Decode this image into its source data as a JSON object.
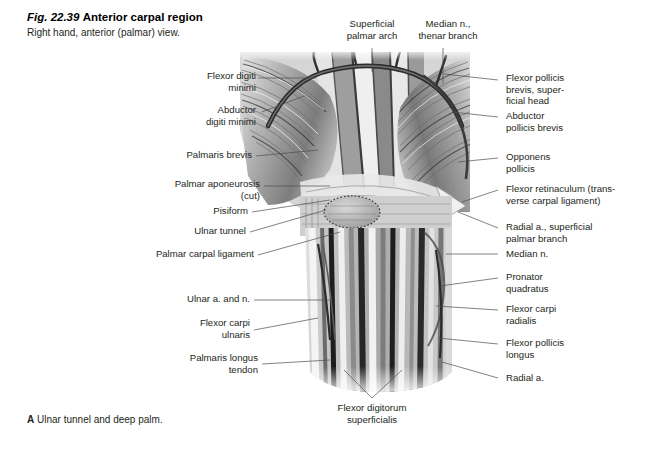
{
  "figure": {
    "number": "Fig. 22.39",
    "title": "Anterior carpal region",
    "subtitle": "Right hand, anterior (palmar) view.",
    "panel_letter": "A",
    "caption": "Ulnar tunnel and deep palm.",
    "view_type": "anatomical-illustration",
    "palette": {
      "background": "#ffffff",
      "text": "#231f20",
      "leader_line": "#4d4d4d",
      "art_dark": "#2b2b2b",
      "art_mid": "#8d8d8d",
      "art_light": "#dcdcdc"
    }
  },
  "labels": {
    "top": [
      {
        "id": "superficial-palmar-arch",
        "text": "Superficial\npalmar arch"
      },
      {
        "id": "median-n-thenar-branch",
        "text": "Median n.,\nthenar branch"
      }
    ],
    "left": [
      {
        "id": "flexor-digiti-minimi",
        "text": "Flexor digiti\nminimi"
      },
      {
        "id": "abductor-digiti-minimi",
        "text": "Abductor\ndigiti minimi"
      },
      {
        "id": "palmaris-brevis",
        "text": "Palmaris brevis"
      },
      {
        "id": "palmar-aponeurosis-cut",
        "text": "Palmar aponeurosis\n(cut)"
      },
      {
        "id": "pisiform",
        "text": "Pisiform"
      },
      {
        "id": "ulnar-tunnel",
        "text": "Ulnar tunnel"
      },
      {
        "id": "palmar-carpal-ligament",
        "text": "Palmar carpal ligament"
      },
      {
        "id": "ulnar-a-and-n",
        "text": "Ulnar a. and n."
      },
      {
        "id": "flexor-carpi-ulnaris",
        "text": "Flexor carpi\nulnaris"
      },
      {
        "id": "palmaris-longus-tendon",
        "text": "Palmaris longus\ntendon"
      }
    ],
    "right": [
      {
        "id": "flexor-pollicis-brevis",
        "text": "Flexor pollicis\nbrevis, super-\nficial head"
      },
      {
        "id": "abductor-pollicis-brevis",
        "text": "Abductor\npollicis brevis"
      },
      {
        "id": "opponens-pollicis",
        "text": "Opponens\npollicis"
      },
      {
        "id": "flexor-retinaculum",
        "text": "Flexor retinaculum (trans-\nverse carpal ligament)"
      },
      {
        "id": "radial-a-superficial-palmar-branch",
        "text": "Radial a., superficial\npalmar branch"
      },
      {
        "id": "median-n",
        "text": "Median n."
      },
      {
        "id": "pronator-quadratus",
        "text": "Pronator\nquadratus"
      },
      {
        "id": "flexor-carpi-radialis",
        "text": "Flexor carpi\nradialis"
      },
      {
        "id": "flexor-pollicis-longus",
        "text": "Flexor pollicis\nlongus"
      },
      {
        "id": "radial-a",
        "text": "Radial a."
      }
    ],
    "bottom": [
      {
        "id": "flexor-digitorum-superficialis",
        "text": "Flexor digitorum\nsuperficialis"
      }
    ]
  }
}
